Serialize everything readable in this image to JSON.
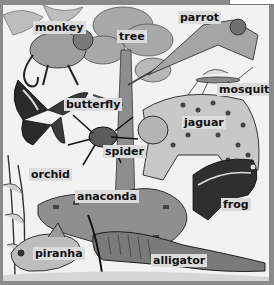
{
  "illustration": {
    "subject": "rainforest animals and plants",
    "style": "grayscale engraving",
    "frame_color": "#8a8a8a",
    "label_bg": "#dcdcdc",
    "labels": [
      {
        "id": "monkey",
        "text": "monkey",
        "x": 30,
        "y": 21
      },
      {
        "id": "tree",
        "text": "tree",
        "x": 114,
        "y": 30
      },
      {
        "id": "parrot",
        "text": "parrot",
        "x": 175,
        "y": 11
      },
      {
        "id": "mosquito",
        "text": "mosquito",
        "x": 215,
        "y": 83
      },
      {
        "id": "butterfly",
        "text": "butterfly",
        "x": 61,
        "y": 98
      },
      {
        "id": "jaguar",
        "text": "jaguar",
        "x": 179,
        "y": 116
      },
      {
        "id": "spider",
        "text": "spider",
        "x": 100,
        "y": 145
      },
      {
        "id": "orchid",
        "text": "orchid",
        "x": 26,
        "y": 168
      },
      {
        "id": "anaconda",
        "text": "anaconda",
        "x": 72,
        "y": 190
      },
      {
        "id": "frog",
        "text": "frog",
        "x": 218,
        "y": 198
      },
      {
        "id": "piranha",
        "text": "piranha",
        "x": 30,
        "y": 247
      },
      {
        "id": "alligator",
        "text": "alligator",
        "x": 148,
        "y": 254
      }
    ]
  }
}
